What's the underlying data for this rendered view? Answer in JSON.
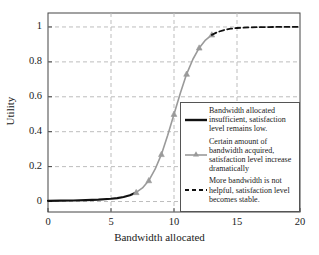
{
  "chart_data": {
    "type": "line",
    "title": "",
    "xlabel": "Bandwidth allocated",
    "ylabel": "Utility",
    "xlim": [
      0,
      20
    ],
    "ylim": [
      -0.06,
      1.08
    ],
    "xticks": [
      0,
      5,
      10,
      15,
      20
    ],
    "yticks": [
      0,
      0.2,
      0.4,
      0.6,
      0.8,
      1
    ],
    "xtick_labels": [
      "0",
      "5",
      "10",
      "15",
      "20"
    ],
    "ytick_labels": [
      "0",
      "0.2",
      "0.4",
      "0.6",
      "0.8",
      "1"
    ],
    "grid": true,
    "grid_style": "dashed",
    "legend_position": "lower-right-inside",
    "series": [
      {
        "name": "insufficient-bandwidth-segment",
        "style": "solid",
        "color": "#111111",
        "width": 2.2,
        "markers": false,
        "x": [
          0,
          1,
          2,
          3,
          4,
          5,
          5.5,
          6,
          6.5,
          7
        ],
        "y": [
          0.004,
          0.005,
          0.006,
          0.008,
          0.011,
          0.016,
          0.02,
          0.026,
          0.036,
          0.052
        ]
      },
      {
        "name": "dramatic-increase-segment",
        "style": "solid",
        "color": "#9a9a9a",
        "width": 1.6,
        "markers": true,
        "marker_shape": "triangle",
        "x": [
          7,
          7.5,
          8,
          8.5,
          9,
          9.5,
          10,
          10.5,
          11,
          11.5,
          12,
          12.5,
          13
        ],
        "y": [
          0.052,
          0.078,
          0.12,
          0.185,
          0.27,
          0.38,
          0.5,
          0.62,
          0.73,
          0.815,
          0.88,
          0.925,
          0.955
        ],
        "marker_x": [
          7,
          8,
          9,
          10,
          11,
          12,
          13
        ],
        "marker_y": [
          0.052,
          0.12,
          0.27,
          0.5,
          0.73,
          0.88,
          0.955
        ]
      },
      {
        "name": "stable-saturation-segment",
        "style": "dashed",
        "color": "#111111",
        "width": 1.8,
        "markers": false,
        "x": [
          13,
          13.5,
          14,
          14.5,
          15,
          16,
          17,
          18,
          19,
          20
        ],
        "y": [
          0.955,
          0.972,
          0.983,
          0.99,
          0.994,
          0.998,
          0.999,
          1.0,
          1.0,
          1.0
        ]
      }
    ],
    "legend": [
      {
        "sample": "solid-black-line",
        "text": "Bandwidth allocated insufficient, satisfaction level remains low."
      },
      {
        "sample": "gray-line-with-marker",
        "text": "Certain amount of bandwidth acquired, satisfaction level increase dramatically"
      },
      {
        "sample": "dashed-black-line",
        "text": "More bandwidth is not helpful, satisfaction level becomes stable."
      }
    ],
    "colors": {
      "axis": "#444444",
      "grid": "#bdbdbd",
      "solid_series": "#111111",
      "gray_series": "#9a9a9a",
      "dashed_series": "#111111",
      "background": "#ffffff"
    }
  }
}
